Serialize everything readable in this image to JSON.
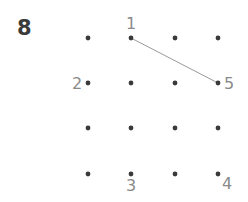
{
  "puzzle_number": "8",
  "grid": {
    "cols_x": [
      88,
      131,
      175,
      218
    ],
    "rows_y": [
      38,
      83,
      128,
      174
    ],
    "dot_color": "#3a3a3a"
  },
  "labels": [
    {
      "text": "1",
      "x": 126,
      "y": 14
    },
    {
      "text": "2",
      "x": 72,
      "y": 74
    },
    {
      "text": "5",
      "x": 224,
      "y": 74
    },
    {
      "text": "3",
      "x": 126,
      "y": 176
    },
    {
      "text": "4",
      "x": 222,
      "y": 174
    }
  ],
  "line": {
    "from": [
      131,
      38
    ],
    "to": [
      218,
      83
    ],
    "color": "#9a9a9a"
  }
}
